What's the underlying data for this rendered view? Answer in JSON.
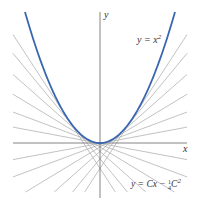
{
  "diagram": {
    "axes": {
      "x_label": "x",
      "y_label": "y",
      "axis_color": "#555555"
    },
    "curve": {
      "label": "y = x",
      "label_exp": "2",
      "color": "#3a67b0",
      "equation": "y = x^2"
    },
    "tangent_lines": {
      "label_prefix": "y = Cx − ",
      "label_frac_num": "1",
      "label_frac_den": "4",
      "label_suffix": "C",
      "label_exp": "2",
      "equation": "y = Cx - (1/4)C^2",
      "color": "#a8a8a8",
      "touch_offsets": [
        -33,
        -26,
        -19,
        -13,
        -8,
        -4,
        4,
        8,
        13,
        19,
        26,
        33
      ]
    }
  }
}
